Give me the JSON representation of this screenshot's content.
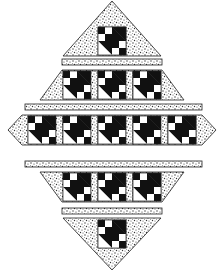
{
  "figure": {
    "title": "Quilt table runner diagram"
  },
  "colors": {
    "background": "#ffffff",
    "dark": "#111111",
    "light": "#ffffff",
    "outline": "#222222",
    "speckle_bg": "#ffffff",
    "speckle_dot": "#333333"
  },
  "layout": {
    "block_size": 28,
    "rows": [
      {
        "name": "top-triangle",
        "blocks": 1,
        "y": 27,
        "shape": "triangle-up",
        "apex_y": 1,
        "base_y": 56,
        "left_x": 63,
        "right_x": 161
      },
      {
        "name": "sash-1",
        "type": "sashing",
        "y": 59,
        "h": 6,
        "x": 62,
        "w": 100
      },
      {
        "name": "row-2",
        "blocks": 3,
        "y": 70,
        "shape": "trapezoid-up",
        "top_left": 62,
        "top_right": 162,
        "bottom_left": 40,
        "bottom_right": 184
      },
      {
        "name": "sash-2",
        "type": "sashing",
        "y": 104,
        "h": 6,
        "x": 25,
        "w": 177
      },
      {
        "name": "row-3",
        "blocks": 5,
        "y": 115,
        "shape": "hexagon",
        "left_tip": 8,
        "right_tip": 216
      },
      {
        "name": "sash-3",
        "type": "sashing",
        "y": 161,
        "h": 6,
        "x": 25,
        "w": 177
      },
      {
        "name": "row-4",
        "blocks": 3,
        "y": 172,
        "shape": "trapezoid-down",
        "top_left": 40,
        "top_right": 184,
        "bottom_left": 62,
        "bottom_right": 162
      },
      {
        "name": "sash-4",
        "type": "sashing",
        "y": 208,
        "h": 6,
        "x": 62,
        "w": 100
      },
      {
        "name": "bottom-triangle",
        "blocks": 1,
        "y": 218,
        "shape": "triangle-down",
        "base_y": 218,
        "apex_y": 270,
        "left_x": 63,
        "right_x": 161
      }
    ]
  },
  "block_pattern": {
    "name": "pieced-block",
    "grid": 4,
    "four_patch_top_left": [
      "dark",
      "light",
      "light",
      "dark"
    ],
    "four_patch_bottom_right": [
      "dark",
      "light",
      "light",
      "dark"
    ],
    "half_square_triangles": "upper-right dark, lower-left light"
  }
}
